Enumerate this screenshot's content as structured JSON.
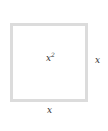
{
  "diagram": {
    "shape": "square",
    "area_label": {
      "base": "x",
      "exponent": "2"
    },
    "side_right_label": "x",
    "side_bottom_label": "x",
    "colors": {
      "border": "#dcdcdc",
      "text": "#333333",
      "background": "#ffffff"
    }
  }
}
